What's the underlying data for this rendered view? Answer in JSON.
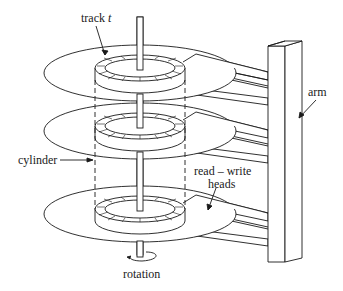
{
  "figure": {
    "labels": {
      "track": "track",
      "track_var": "t",
      "arm": "arm",
      "cylinder": "cylinder",
      "read_write_line1": "read – write",
      "read_write_line2": "heads",
      "rotation": "rotation"
    },
    "components": [
      "spindle",
      "platter-top",
      "platter-middle",
      "platter-bottom",
      "track",
      "cylinder",
      "arm-assembly",
      "read-write-heads",
      "rotation-arrow"
    ],
    "colors": {
      "line": "#1a1a1a",
      "background": "#ffffff"
    }
  }
}
